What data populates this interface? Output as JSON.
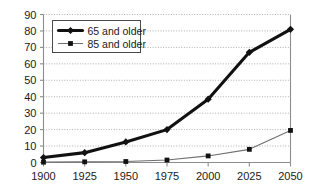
{
  "chart_data": {
    "type": "line",
    "title": "",
    "subtitle": "",
    "xlabel": "",
    "ylabel": "",
    "x": [
      1900,
      1925,
      1950,
      1975,
      2000,
      2025,
      2050
    ],
    "categories": [
      "1900",
      "1925",
      "1950",
      "1975",
      "2000",
      "2025",
      "2050"
    ],
    "series": [
      {
        "name": "65 and older",
        "values": [
          3,
          6,
          12.5,
          20,
          38.5,
          67,
          81
        ],
        "marker": "diamond",
        "line_width": "thick",
        "color": "#111111"
      },
      {
        "name": "85 and older",
        "values": [
          0.2,
          0.4,
          0.6,
          1.5,
          4,
          8,
          19.5
        ],
        "marker": "square",
        "line_width": "thin",
        "color": "#6f6f6f"
      }
    ],
    "ylim": [
      0,
      90
    ],
    "xlim": [
      1900,
      2050
    ],
    "y_ticks": [
      0,
      10,
      20,
      30,
      40,
      50,
      60,
      70,
      80,
      90
    ],
    "y_tick_labels": [
      "0",
      "10",
      "20",
      "30",
      "40",
      "50",
      "60",
      "70",
      "80",
      "90"
    ],
    "x_ticks": [
      1900,
      1925,
      1950,
      1975,
      2000,
      2025,
      2050
    ],
    "x_tick_labels": [
      "1900",
      "1925",
      "1950",
      "1975",
      "2000",
      "2025",
      "2050"
    ],
    "grid": "horizontal-dotted",
    "legend_position": "top-left-inside",
    "legend_entries": [
      "65 and older",
      "85 and older"
    ],
    "background_color": "#ffffff",
    "axis_color": "#8d8d8d",
    "grid_color": "#9a9a9a"
  },
  "axes": {
    "y_labels": [
      "90",
      "80",
      "70",
      "60",
      "50",
      "40",
      "30",
      "20",
      "10",
      "0"
    ],
    "x_labels": [
      "1900",
      "1925",
      "1950",
      "1975",
      "2000",
      "2025",
      "2050"
    ]
  },
  "legend": {
    "entry_1_label": "65 and older",
    "entry_2_label": "85 and older"
  }
}
